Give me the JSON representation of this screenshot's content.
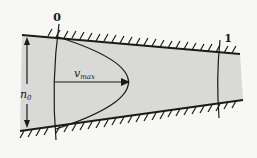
{
  "diagram": {
    "section_labels": {
      "inlet": "0",
      "outlet": "1"
    },
    "velocity_label": "v",
    "velocity_subscript": "max",
    "height_label": "n",
    "height_subscript": "0",
    "colors": {
      "fluid": "#d9d9d7",
      "wall": "#1a1a1a",
      "background": "#f7f7f5"
    }
  }
}
